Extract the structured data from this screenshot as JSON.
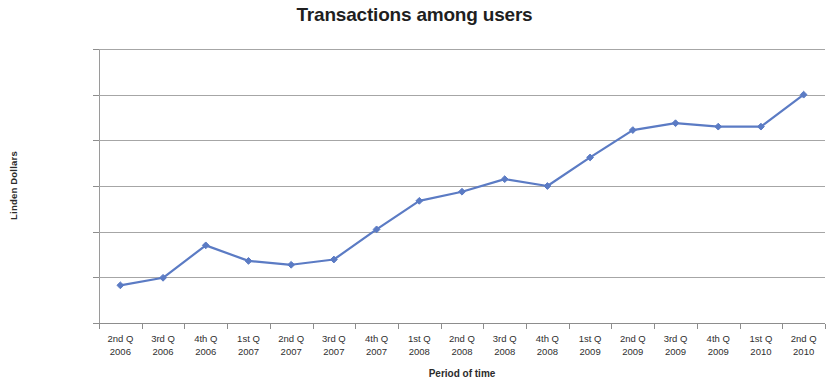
{
  "chart_data": {
    "type": "line",
    "title": "Transactions among users",
    "xlabel": "Period of time",
    "ylabel": "Linden Dollars",
    "grid": true,
    "legend": "none",
    "ylim": [
      0,
      120000000
    ],
    "ytick_labels": [
      "120 000 000",
      "100 000 000",
      "80 000 000",
      "60 000 000",
      "40 000 000",
      "20 000 000",
      "0"
    ],
    "ytick_values": [
      120000000,
      100000000,
      80000000,
      60000000,
      40000000,
      20000000,
      0
    ],
    "categories": [
      "2nd Q\n2006",
      "3rd Q\n2006",
      "4th Q\n2006",
      "1st Q\n2007",
      "2nd Q\n2007",
      "3rd Q\n2007",
      "4th Q\n2007",
      "1st Q\n2008",
      "2nd Q\n2008",
      "3rd Q\n2008",
      "4th Q\n2008",
      "1st Q\n2009",
      "2nd Q\n2009",
      "3rd Q\n2009",
      "4th Q\n2009",
      "1st Q\n2010",
      "2nd Q\n2010"
    ],
    "category_lines": [
      [
        "2nd Q",
        "2006"
      ],
      [
        "3rd Q",
        "2006"
      ],
      [
        "4th Q",
        "2006"
      ],
      [
        "1st Q",
        "2007"
      ],
      [
        "2nd Q",
        "2007"
      ],
      [
        "3rd Q",
        "2007"
      ],
      [
        "4th Q",
        "2007"
      ],
      [
        "1st Q",
        "2008"
      ],
      [
        "2nd Q",
        "2008"
      ],
      [
        "3rd Q",
        "2008"
      ],
      [
        "4th Q",
        "2008"
      ],
      [
        "1st Q",
        "2009"
      ],
      [
        "2nd Q",
        "2009"
      ],
      [
        "3rd Q",
        "2009"
      ],
      [
        "4th Q",
        "2009"
      ],
      [
        "1st Q",
        "2010"
      ],
      [
        "2nd Q",
        "2010"
      ]
    ],
    "series": [
      {
        "name": "Transactions among users",
        "color": "#5B7BC4",
        "marker": "diamond",
        "values": [
          16500000,
          19800000,
          34000000,
          27200000,
          25500000,
          27800000,
          41000000,
          53500000,
          57500000,
          63000000,
          60000000,
          72500000,
          84500000,
          87500000,
          86000000,
          86000000,
          100000000
        ]
      }
    ]
  },
  "colors": {
    "series_blue": "#5B7BC4",
    "gridline_gray": "#A6A6A6",
    "text_dark": "#2B2B2B"
  }
}
